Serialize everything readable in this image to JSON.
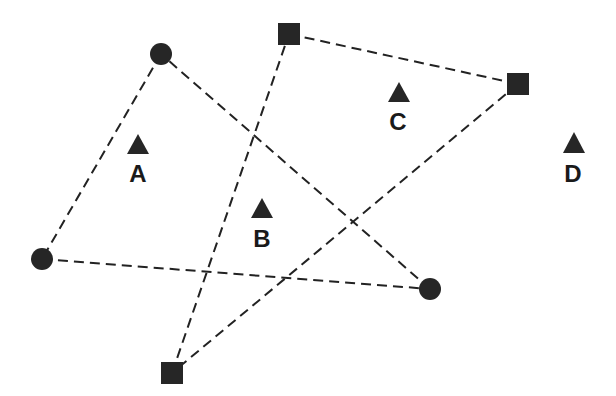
{
  "diagram": {
    "colors": {
      "marker": "#262626",
      "edge": "#222222",
      "text": "#1a1a1a",
      "background": "#ffffff"
    },
    "circle_nodes": [
      {
        "id": "c1"
      },
      {
        "id": "c2"
      },
      {
        "id": "c3"
      }
    ],
    "square_nodes": [
      {
        "id": "s1"
      },
      {
        "id": "s2"
      },
      {
        "id": "s3"
      }
    ],
    "circle_edges": [
      [
        "c1",
        "c2"
      ],
      [
        "c2",
        "c3"
      ],
      [
        "c3",
        "c1"
      ]
    ],
    "square_edges": [
      [
        "s1",
        "s2"
      ],
      [
        "s2",
        "s3"
      ],
      [
        "s3",
        "s1"
      ]
    ],
    "markers": [
      {
        "id": "A",
        "label": "A"
      },
      {
        "id": "B",
        "label": "B"
      },
      {
        "id": "C",
        "label": "C"
      },
      {
        "id": "D",
        "label": "D"
      }
    ]
  }
}
